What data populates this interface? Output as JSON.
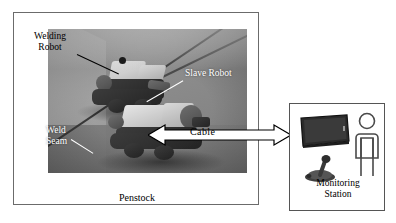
{
  "figure": {
    "left_panel": {
      "name": "penstock-scene",
      "caption": "Penstock",
      "labels": [
        {
          "id": "welding-robot",
          "text": "Welding\nRobot",
          "color": "#000000"
        },
        {
          "id": "slave-robot",
          "text": "Slave Robot",
          "color": "#ffffff"
        },
        {
          "id": "weld-seam",
          "text": "Weld\nSeam",
          "color": "#ffffff"
        }
      ],
      "photo_alt_tones": {
        "wall": "#8e8e8e",
        "floor": "#6f6f6f",
        "seam": "#3a3a3a"
      }
    },
    "connector": {
      "label": "Cable",
      "style": "double-headed-hollow-arrow",
      "color": "#000000"
    },
    "right_panel": {
      "name": "monitoring-station",
      "caption_line1": "Monitoring",
      "caption_line2": "Station",
      "items": [
        {
          "id": "monitor",
          "icon": "monitor-icon",
          "color": "#2b2b2b"
        },
        {
          "id": "joystick",
          "icon": "joystick-icon",
          "color": "#3a3a3a"
        },
        {
          "id": "operator",
          "icon": "person-icon",
          "color": "#4a4a4a"
        }
      ]
    }
  }
}
